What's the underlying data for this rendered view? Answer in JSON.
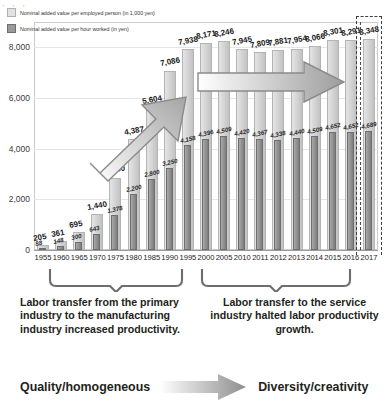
{
  "top_cut_text": "・    ・    ・",
  "legend": {
    "series1": "Nominal added value per employed person (in 1,000 yen)",
    "series2": "Nominal added value per hour worked (in yen)"
  },
  "chart_data": {
    "type": "bar",
    "title": "",
    "xlabel": "",
    "ylabel": "",
    "ylim": [
      0,
      9000
    ],
    "yticks": [
      "0",
      "2,000",
      "4,000",
      "6,000",
      "8,000"
    ],
    "ytick_values": [
      0,
      2000,
      4000,
      6000,
      8000
    ],
    "grid": true,
    "legend_position": "top-left",
    "categories": [
      "1955",
      "1960",
      "1965",
      "1970",
      "1975",
      "1980",
      "1985",
      "1990",
      "1995",
      "2000",
      "2005",
      "2010",
      "2011",
      "2012",
      "2013",
      "2014",
      "2015",
      "2016",
      "2017"
    ],
    "series": [
      {
        "name": "Nominal added value per employed person (in 1,000 yen)",
        "values": [
          205,
          361,
          695,
          1440,
          2840,
          4387,
          5604,
          7086,
          7938,
          8171,
          8246,
          7945,
          7809,
          7881,
          7954,
          8066,
          8301,
          8291,
          8348
        ],
        "labels": [
          "205",
          "361",
          "695",
          "1,440",
          "2,840",
          "4,387",
          "5,604",
          "7,086",
          "7,938",
          "8,171",
          "8,246",
          "7,945",
          "7,809",
          "7,881",
          "7,954",
          "8,066",
          "8,301",
          "8,291",
          "8,348"
        ]
      },
      {
        "name": "Nominal added value per hour worked (in yen)",
        "values": [
          88,
          148,
          300,
          643,
          1378,
          2200,
          2800,
          3250,
          4158,
          4396,
          4509,
          4420,
          4367,
          4338,
          4440,
          4509,
          4652,
          4652,
          4689
        ],
        "labels": [
          "88",
          "148",
          "300",
          "643",
          "1,378",
          "2,200",
          "2,800",
          "3,250",
          "4,158",
          "4,396",
          "4,509",
          "4,420",
          "4,367",
          "4,338",
          "4,440",
          "4,509",
          "4,652",
          "4,652",
          "4,689"
        ]
      }
    ],
    "annotations": {
      "rising_arrow": "upward growth arrow 1975-1995",
      "flat_arrow": "flat horizontal arrow 2000-2015",
      "forecast_marker": "dashed separator before 2017"
    }
  },
  "captions": {
    "left": "Labor transfer from the primary industry to the manufacturing industry increased productivity.",
    "right": "Labor transfer to the service industry halted labor productivity growth."
  },
  "bottom": {
    "left_term": "Quality/homogeneous",
    "right_term": "Diversity/creativity"
  }
}
